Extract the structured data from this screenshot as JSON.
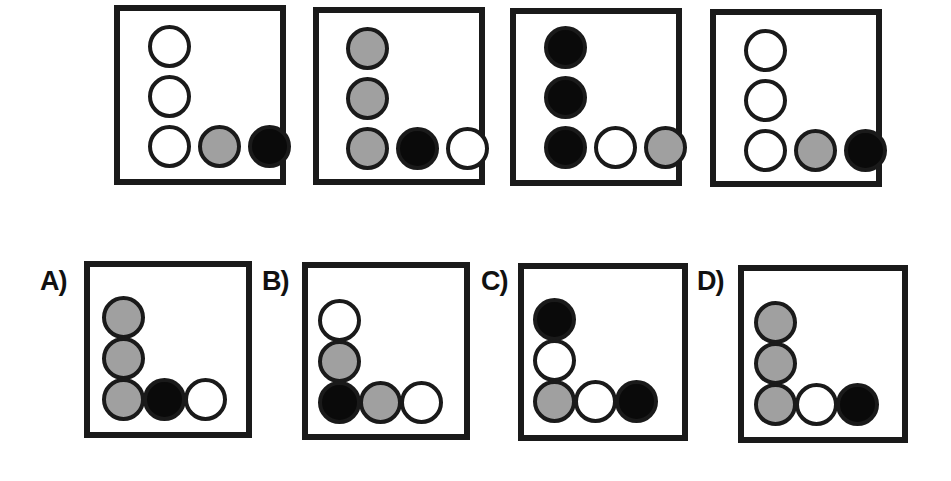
{
  "sequence": [
    {
      "id": "seq-1",
      "vertical": [
        "white",
        "white",
        "white"
      ],
      "horizontal": [
        "gray",
        "black"
      ]
    },
    {
      "id": "seq-2",
      "vertical": [
        "gray",
        "gray",
        "gray"
      ],
      "horizontal": [
        "black",
        "white"
      ]
    },
    {
      "id": "seq-3",
      "vertical": [
        "black",
        "black",
        "black"
      ],
      "horizontal": [
        "white",
        "gray"
      ]
    },
    {
      "id": "seq-4",
      "vertical": [
        "white",
        "white",
        "white"
      ],
      "horizontal": [
        "gray",
        "black"
      ]
    }
  ],
  "options": [
    {
      "label": "A)",
      "vertical": [
        "gray",
        "gray",
        "gray"
      ],
      "horizontal": [
        "black",
        "white"
      ]
    },
    {
      "label": "B)",
      "vertical": [
        "white",
        "gray",
        "black"
      ],
      "horizontal": [
        "gray",
        "white"
      ]
    },
    {
      "label": "C)",
      "vertical": [
        "black",
        "white",
        "gray"
      ],
      "horizontal": [
        "white",
        "black"
      ]
    },
    {
      "label": "D)",
      "vertical": [
        "gray",
        "gray",
        "gray"
      ],
      "horizontal": [
        "white",
        "black"
      ]
    }
  ],
  "colors": {
    "white": "#ffffff",
    "gray": "#a0a0a0",
    "black": "#0a0a0a",
    "border": "#1a1a1a"
  }
}
